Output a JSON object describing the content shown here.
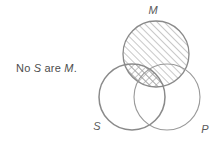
{
  "caption": {
    "prefix": "No ",
    "subject": "S",
    "middle": " are ",
    "predicate": "M",
    "suffix": ".",
    "full_text": "No S are M."
  },
  "diagram": {
    "type": "venn-three-circle",
    "labels": {
      "s": "S",
      "m": "M",
      "p": "P"
    },
    "colors": {
      "stroke": "#8a8a8a",
      "stroke_emphasis": "#7a7a7a",
      "hatch": "#9a9a9a",
      "label": "#5a5a5a",
      "caption": "#4d4d4d",
      "background": "#ffffff"
    },
    "circles": [
      {
        "id": "m",
        "cx": 156,
        "cy": 54,
        "r": 33,
        "label": "M",
        "label_x": 153,
        "label_y": 13,
        "shaded": true,
        "shading": "diagonal-hatch"
      },
      {
        "id": "s",
        "cx": 132,
        "cy": 97,
        "r": 33,
        "label": "S",
        "label_x": 97,
        "label_y": 128,
        "shaded": false,
        "shading": "none"
      },
      {
        "id": "p",
        "cx": 167,
        "cy": 97,
        "r": 33,
        "label": "P",
        "label_x": 204,
        "label_y": 131,
        "shaded": false,
        "shading": "none"
      }
    ],
    "regions": [
      {
        "id": "m-only",
        "shading": "diagonal-hatch",
        "description": "M circle interior"
      },
      {
        "id": "s-and-m",
        "shading": "cross-hatch",
        "description": "overlap of S and M is double-hatched (empty)"
      },
      {
        "id": "m-and-p",
        "shading": "diagonal-hatch",
        "description": "overlap of M and P"
      }
    ]
  }
}
